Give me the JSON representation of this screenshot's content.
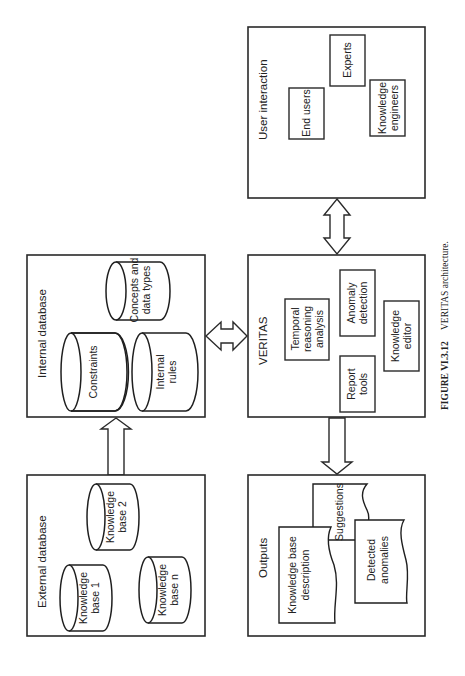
{
  "diagram": {
    "orientation": "rotated 90 degrees counter-clockwise",
    "boxes": {
      "user_interaction": {
        "title": "User interaction",
        "items": [
          "End users",
          "Experts",
          "Knowledge engineers"
        ]
      },
      "veritas": {
        "title": "VERITAS",
        "items": [
          "Temporal reasoning analysis",
          "Anomaly detection",
          "Report tools",
          "Knowledge editor"
        ]
      },
      "internal_database": {
        "title": "Internal database",
        "items": [
          "Constraints",
          "Concepts and data types",
          "Internal rules"
        ]
      },
      "external_database": {
        "title": "External database",
        "items": [
          "Knowledge base 1",
          "Knowledge base 2",
          "Knowledge base n"
        ]
      },
      "outputs": {
        "title": "Outputs",
        "items": [
          "Knowledge base description",
          "Suggestions",
          "Detected anomalies"
        ]
      }
    },
    "lines": {
      "ui_end_users": "End users",
      "ui_experts": "Experts",
      "ui_ke_1": "Knowledge",
      "ui_ke_2": "engineers",
      "v_temporal_1": "Temporal",
      "v_temporal_2": "reasoning",
      "v_temporal_3": "analysis",
      "v_anomaly_1": "Anomaly",
      "v_anomaly_2": "detection",
      "v_report_1": "Report",
      "v_report_2": "tools",
      "v_editor_1": "Knowledge",
      "v_editor_2": "editor",
      "idb_constraints": "Constraints",
      "idb_concepts_1": "Concepts and",
      "idb_concepts_2": "data types",
      "idb_rules_1": "Internal",
      "idb_rules_2": "rules",
      "edb_kb1_1": "Knowledge",
      "edb_kb1_2": "base 1",
      "edb_kb2_1": "Knowledge",
      "edb_kb2_2": "base 2",
      "edb_kbn_1": "Knowledge",
      "edb_kbn_2": "base n",
      "out_kbd_1": "Knowledge base",
      "out_kbd_2": "description",
      "out_sugg": "Suggestions",
      "out_anom_1": "Detected",
      "out_anom_2": "anomalies"
    },
    "connections": [
      {
        "from": "External database",
        "to": "Internal database",
        "type": "one-way"
      },
      {
        "from": "Internal database",
        "to": "VERITAS",
        "type": "two-way"
      },
      {
        "from": "VERITAS",
        "to": "User interaction",
        "type": "two-way"
      },
      {
        "from": "VERITAS",
        "to": "Outputs",
        "type": "one-way"
      }
    ]
  },
  "caption": {
    "label": "FIGURE VI.3.12",
    "text": "VERITAS architecture."
  }
}
